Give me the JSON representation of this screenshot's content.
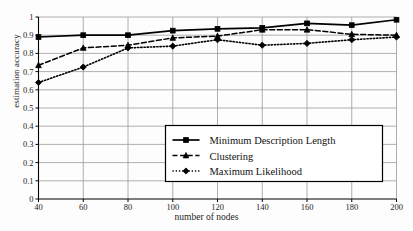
{
  "chart_data": {
    "type": "line",
    "title": "",
    "xlabel": "number of nodes",
    "ylabel": "estimation accuracy",
    "x": [
      40,
      60,
      80,
      100,
      120,
      140,
      160,
      180,
      200
    ],
    "xlim": [
      40,
      200
    ],
    "ylim": [
      0,
      1
    ],
    "xticks": [
      "40",
      "60",
      "80",
      "100",
      "120",
      "140",
      "160",
      "180",
      "200"
    ],
    "yticks": [
      "0",
      "0.1",
      "0.2",
      "0.3",
      "0.4",
      "0.5",
      "0.6",
      "0.7",
      "0.8",
      "0.9",
      "1"
    ],
    "grid": true,
    "legend_position": "center-right-inside",
    "series": [
      {
        "name": "Minimum Description Length",
        "marker": "square",
        "linestyle": "solid",
        "color": "#000000",
        "values": [
          0.89,
          0.9,
          0.9,
          0.925,
          0.935,
          0.94,
          0.965,
          0.955,
          0.985
        ]
      },
      {
        "name": "Clustering",
        "marker": "triangle",
        "linestyle": "dashed",
        "color": "#000000",
        "values": [
          0.735,
          0.83,
          0.845,
          0.885,
          0.895,
          0.93,
          0.93,
          0.905,
          0.9
        ]
      },
      {
        "name": "Maximum Likelihood",
        "marker": "diamond",
        "linestyle": "dotted",
        "color": "#000000",
        "values": [
          0.64,
          0.725,
          0.83,
          0.84,
          0.875,
          0.845,
          0.855,
          0.875,
          0.89
        ]
      }
    ]
  },
  "axes": {
    "ylabel": "estimation accuracy",
    "xlabel": "number of nodes"
  },
  "legend": {
    "items": [
      {
        "label": "Minimum Description Length"
      },
      {
        "label": "Clustering"
      },
      {
        "label": "Maximum Likelihood"
      }
    ]
  },
  "colors": {
    "ink": "#000000",
    "grid": "#9a9a9a",
    "background": "#fdfdfd"
  }
}
